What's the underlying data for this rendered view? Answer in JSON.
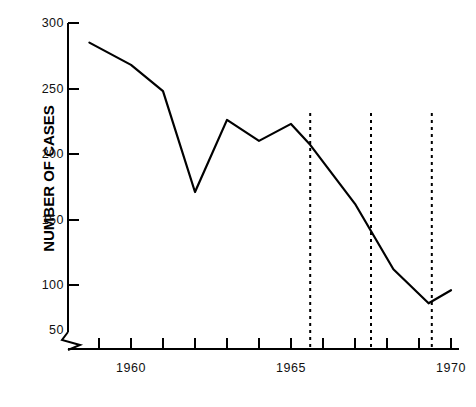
{
  "chart_data": {
    "type": "line",
    "title": "",
    "xlabel": "",
    "ylabel": "NUMBER OF CASES",
    "xlim": [
      1958.5,
      1970.5
    ],
    "ylim": [
      50,
      300
    ],
    "grid": false,
    "legend": null,
    "y_ticks": [
      50,
      100,
      150,
      200,
      250,
      300
    ],
    "y_tick_labels": [
      "50",
      "100",
      "150",
      "200",
      "250",
      "300"
    ],
    "y_axis_break": true,
    "x_ticks": [
      1959,
      1960,
      1961,
      1962,
      1963,
      1964,
      1965,
      1966,
      1967,
      1968,
      1969,
      1970
    ],
    "x_tick_labels_shown": [
      "1960",
      "1965",
      "1970"
    ],
    "x_tick_label_years": [
      1960,
      1965,
      1970
    ],
    "x": [
      1958.7,
      1960.0,
      1961.0,
      1962.0,
      1963.0,
      1964.0,
      1965.0,
      1965.6,
      1967.0,
      1968.2,
      1969.3,
      1970.0
    ],
    "values": [
      285,
      268,
      248,
      171,
      226,
      210,
      223,
      207,
      162,
      112,
      86,
      96
    ],
    "annotations": [
      {
        "type": "vertical-dashed-line",
        "x": 1965.6,
        "label": ""
      },
      {
        "type": "vertical-dashed-line",
        "x": 1967.5,
        "label": ""
      },
      {
        "type": "vertical-dashed-line",
        "x": 1969.4,
        "label": ""
      }
    ],
    "line_color": "#000000",
    "line_width": 2.2,
    "axis_color": "#000000",
    "background": "#ffffff"
  },
  "axis": {
    "y_label": "NUMBER OF CASES",
    "ticks_y": {
      "t300": "300",
      "t250": "250",
      "t200": "200",
      "t150": "150",
      "t100": "100",
      "t50": "50"
    },
    "ticks_x": {
      "x1960": "1960",
      "x1965": "1965",
      "x1970": "1970"
    }
  }
}
